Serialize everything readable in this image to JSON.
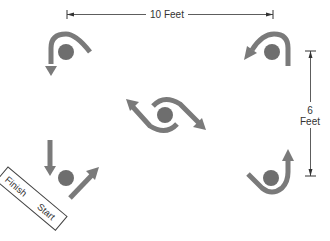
{
  "diagram": {
    "type": "cone drill layout",
    "dimensions": {
      "horizontal": {
        "value": "10",
        "unit": "Feet",
        "label": "10 Feet"
      },
      "vertical": {
        "value": "6",
        "unit": "Feet",
        "line1": "6",
        "line2": "Feet"
      }
    },
    "start_box": {
      "finish_label": "Finish",
      "start_label": "Start"
    },
    "cones": [
      {
        "id": "top-left",
        "path": "hook around top, exit downward"
      },
      {
        "id": "top-right",
        "path": "hook around top, exit down-left"
      },
      {
        "id": "center",
        "path": "figure-eight wrap, arrows up-left and down-right"
      },
      {
        "id": "bottom-left",
        "path": "start/finish cone, arrow in from above, arrow out up-right"
      },
      {
        "id": "bottom-right",
        "path": "wrap under bottom, exit upward"
      }
    ],
    "colors": {
      "arrow": "#7a7a7a",
      "cone": "#6e6e6e",
      "line": "#333333",
      "box_border": "#444444"
    }
  }
}
